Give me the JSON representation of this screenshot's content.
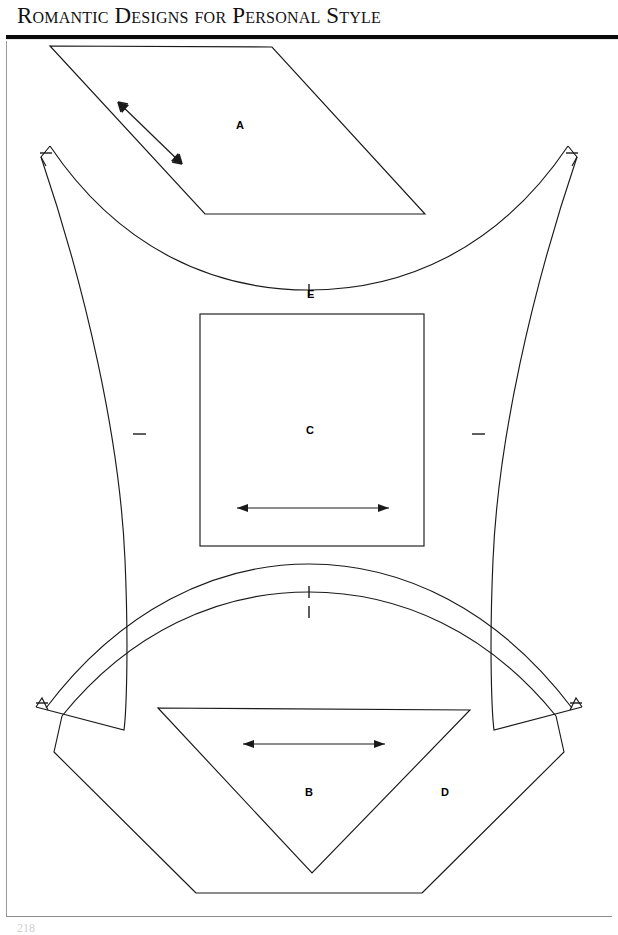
{
  "header": {
    "title": "Romantic Designs for Personal Style",
    "rule_color": "#0b0b0b"
  },
  "page": {
    "background_color": "#ffffff",
    "line_color": "#1a1a1a",
    "page_number": "218",
    "width": 618,
    "height": 935
  },
  "pattern": {
    "caption": "Pattern pieces diagram",
    "line_color": "#1a1a1a",
    "pieces": [
      {
        "id": "A",
        "label": "A",
        "shape": "parallelogram",
        "grainline": "diagonal-double-arrow",
        "notches": 0
      },
      {
        "id": "B",
        "label": "B",
        "shape": "inverted-triangle",
        "grainline": "horizontal-double-arrow",
        "notches": 0
      },
      {
        "id": "C",
        "label": "C",
        "shape": "square",
        "grainline": "horizontal-double-arrow",
        "notches": 0
      },
      {
        "id": "D",
        "label": "D",
        "shape": "fan-arc-segment",
        "grainline": "none",
        "notches": 3
      },
      {
        "id": "E",
        "label": "E",
        "shape": "concave-sided-panel",
        "grainline": "none",
        "notches": 5
      }
    ],
    "markings": {
      "grainline_arrows": 3,
      "notch_marks": 8,
      "arrow_style": "double-headed"
    }
  }
}
